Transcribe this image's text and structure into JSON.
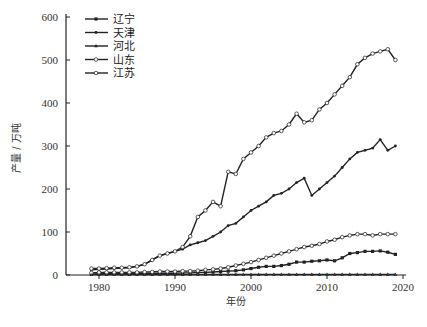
{
  "chart_data": {
    "type": "line",
    "title": "",
    "xlabel": "年份",
    "ylabel": "产量 / 万吨",
    "xlim": [
      1975,
      2021
    ],
    "ylim": [
      0,
      600
    ],
    "x_ticks": [
      1980,
      1990,
      2000,
      2010,
      2020
    ],
    "y_ticks": [
      0,
      100,
      200,
      300,
      400,
      500,
      600
    ],
    "grid": false,
    "legend_position": "upper-left",
    "x": [
      1979,
      1980,
      1981,
      1982,
      1983,
      1984,
      1985,
      1986,
      1987,
      1988,
      1989,
      1990,
      1991,
      1992,
      1993,
      1994,
      1995,
      1996,
      1997,
      1998,
      1999,
      2000,
      2001,
      2002,
      2003,
      2004,
      2005,
      2006,
      2007,
      2008,
      2009,
      2010,
      2011,
      2012,
      2013,
      2014,
      2015,
      2016,
      2017,
      2018,
      2019
    ],
    "series": [
      {
        "name": "辽宁",
        "marker": "filled-square",
        "values": [
          2,
          3,
          3,
          3,
          3,
          3,
          3,
          3,
          3,
          4,
          4,
          4,
          5,
          5,
          6,
          6,
          7,
          8,
          9,
          10,
          12,
          15,
          18,
          20,
          20,
          22,
          25,
          30,
          30,
          32,
          33,
          35,
          33,
          40,
          50,
          52,
          55,
          55,
          56,
          53,
          48
        ]
      },
      {
        "name": "天津",
        "marker": "filled-small",
        "values": [
          12,
          13,
          14,
          15,
          16,
          17,
          20,
          25,
          35,
          45,
          50,
          55,
          60,
          70,
          75,
          80,
          90,
          100,
          115,
          120,
          135,
          150,
          160,
          170,
          185,
          190,
          200,
          215,
          225,
          185,
          200,
          215,
          230,
          250,
          270,
          285,
          290,
          295,
          315,
          290,
          300
        ]
      },
      {
        "name": "河北",
        "marker": "filled-triangle",
        "values": [
          1,
          1,
          1,
          1,
          1,
          1,
          1,
          1,
          1,
          1,
          1,
          1,
          1,
          1,
          1,
          1,
          1,
          1,
          1,
          1,
          1,
          1,
          1,
          1,
          1,
          1,
          1,
          1,
          1,
          1,
          1,
          1,
          1,
          1,
          1,
          1,
          1,
          1,
          1,
          1,
          1
        ]
      },
      {
        "name": "山东",
        "marker": "open-circle",
        "values": [
          5,
          6,
          6,
          6,
          6,
          6,
          6,
          7,
          7,
          8,
          8,
          8,
          9,
          9,
          10,
          12,
          13,
          15,
          18,
          22,
          26,
          30,
          35,
          40,
          45,
          50,
          55,
          60,
          65,
          68,
          72,
          78,
          82,
          88,
          92,
          95,
          95,
          92,
          95,
          95,
          95
        ]
      },
      {
        "name": "江苏",
        "marker": "open-circle",
        "values": [
          15,
          15,
          16,
          17,
          17,
          18,
          20,
          25,
          35,
          45,
          50,
          55,
          65,
          90,
          135,
          150,
          170,
          160,
          240,
          235,
          270,
          285,
          300,
          320,
          330,
          335,
          350,
          375,
          355,
          360,
          385,
          400,
          420,
          440,
          460,
          490,
          505,
          515,
          520,
          525,
          500
        ]
      }
    ]
  },
  "legend": {
    "items": [
      {
        "label": "辽宁"
      },
      {
        "label": "天津"
      },
      {
        "label": "河北"
      },
      {
        "label": "山东"
      },
      {
        "label": "江苏"
      }
    ]
  },
  "axes": {
    "xlabel": "年份",
    "ylabel": "产量 / 万吨"
  }
}
